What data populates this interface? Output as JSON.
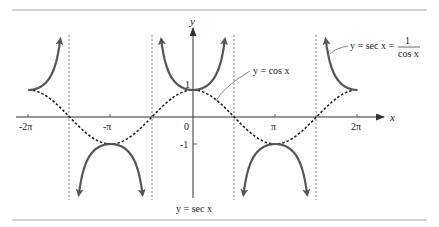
{
  "figure": {
    "title": "y = sec x",
    "axis_x_label": "x",
    "axis_y_label": "y",
    "x_ticks": [
      "-2π",
      "-π",
      "0",
      "π",
      "2π"
    ],
    "y_ticks": [
      "1",
      "-1"
    ],
    "cos_label": "y = cos x",
    "sec_label_lhs": "y = sec x =",
    "sec_label_num": "1",
    "sec_label_den": "cos x",
    "colors": {
      "sec_curve": "#555555",
      "cos_curve": "#111111",
      "asymptote": "#666666",
      "frame": "#aaaaaa"
    }
  },
  "chart_data": {
    "type": "line",
    "title": "y = sec x",
    "xlabel": "x",
    "ylabel": "y",
    "xlim": [
      "-2π",
      "2π"
    ],
    "x_ticks": [
      "-2π",
      "-π",
      "0",
      "π",
      "2π"
    ],
    "y_ticks": [
      1,
      -1
    ],
    "series": [
      {
        "name": "y = cos x",
        "style": "dashed",
        "function": "cos x"
      },
      {
        "name": "y = sec x = 1/cos x",
        "style": "solid",
        "function": "1/cos x"
      }
    ],
    "asymptotes": [
      "-3π/2",
      "-π/2",
      "π/2",
      "3π/2"
    ],
    "grid": false
  }
}
